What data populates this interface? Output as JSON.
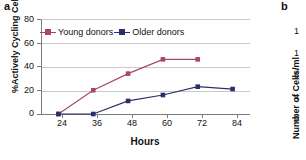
{
  "figure": {
    "panel_a_letter": "a",
    "panel_b_letter": "b"
  },
  "panel_a": {
    "ylabel": "%Actively Cycling Cells",
    "xlabel": "Hours",
    "yticks": [
      "80",
      "60",
      "40",
      "20",
      "0"
    ],
    "xticks": [
      "24",
      "36",
      "48",
      "60",
      "72",
      "84"
    ],
    "legend": [
      {
        "label": "Young donors",
        "color": "#a94864"
      },
      {
        "label": "Older donors",
        "color": "#2b2f6b"
      }
    ]
  },
  "panel_b": {
    "ylabel": "Number of Cells/ml",
    "yticks": [
      "1",
      "1",
      "8",
      "4",
      "0"
    ]
  },
  "chart_data": {
    "type": "line",
    "title": "",
    "xlabel": "Hours",
    "ylabel": "%Actively Cycling Cells",
    "x": [
      24,
      36,
      48,
      60,
      72,
      84
    ],
    "xlim": [
      18,
      90
    ],
    "ylim": [
      0,
      80
    ],
    "yticks": [
      0,
      20,
      40,
      60,
      80
    ],
    "xticks": [
      24,
      36,
      48,
      60,
      72,
      84
    ],
    "grid": "horizontal",
    "legend_position": "top-left-inside",
    "series": [
      {
        "name": "Young donors",
        "color": "#a94864",
        "marker": "square",
        "x": [
          24,
          36,
          48,
          60,
          72
        ],
        "values": [
          0,
          20,
          34,
          46,
          46
        ]
      },
      {
        "name": "Older donors",
        "color": "#2b2f6b",
        "marker": "square",
        "x": [
          24,
          36,
          48,
          60,
          72,
          84
        ],
        "values": [
          0,
          0,
          11,
          16,
          23,
          21
        ]
      }
    ]
  }
}
